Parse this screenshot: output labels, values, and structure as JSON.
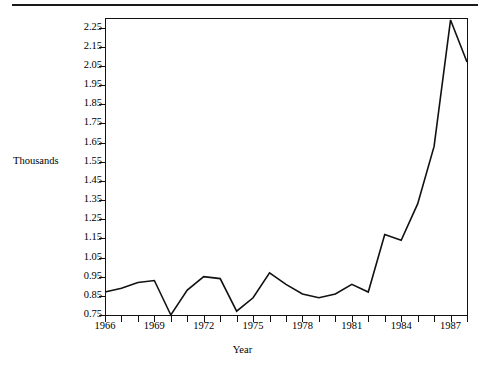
{
  "chart_data": {
    "type": "line",
    "title": "",
    "xlabel": "Year",
    "ylabel": "Thousands",
    "grid": false,
    "legend": "none",
    "line_color": "#111111",
    "xlim": [
      1966,
      1988
    ],
    "ylim": [
      0.75,
      2.3
    ],
    "x_tick_labels": [
      "1966",
      "1969",
      "1972",
      "1975",
      "1978",
      "1981",
      "1984",
      "1987"
    ],
    "x_tick_values": [
      1966,
      1969,
      1972,
      1975,
      1978,
      1981,
      1984,
      1987
    ],
    "x_minor_ticks": [
      1966,
      1967,
      1968,
      1969,
      1970,
      1971,
      1972,
      1973,
      1974,
      1975,
      1976,
      1977,
      1978,
      1979,
      1980,
      1981,
      1982,
      1983,
      1984,
      1985,
      1986,
      1987,
      1988
    ],
    "y_tick_labels": [
      "2.25",
      "2.15",
      "2.05",
      "1.95",
      "1.85",
      "1.75",
      "1.65",
      "1.55",
      "1.45",
      "1.35",
      "1.25",
      "1.15",
      "1.05",
      "0.95",
      "0.85",
      "0.75"
    ],
    "y_tick_values": [
      2.25,
      2.15,
      2.05,
      1.95,
      1.85,
      1.75,
      1.65,
      1.55,
      1.45,
      1.35,
      1.25,
      1.15,
      1.05,
      0.95,
      0.85,
      0.75
    ],
    "x": [
      1966,
      1967,
      1968,
      1969,
      1970,
      1971,
      1972,
      1973,
      1974,
      1975,
      1976,
      1977,
      1978,
      1979,
      1980,
      1981,
      1982,
      1983,
      1984,
      1985,
      1986,
      1987,
      1988
    ],
    "values": [
      0.87,
      0.89,
      0.92,
      0.93,
      0.75,
      0.88,
      0.95,
      0.94,
      0.77,
      0.84,
      0.97,
      0.91,
      0.86,
      0.84,
      0.86,
      0.91,
      0.87,
      1.17,
      1.14,
      1.33,
      1.63,
      2.29,
      2.07
    ],
    "series": [
      {
        "name": "Thousands",
        "values": [
          0.87,
          0.89,
          0.92,
          0.93,
          0.75,
          0.88,
          0.95,
          0.94,
          0.77,
          0.84,
          0.97,
          0.91,
          0.86,
          0.84,
          0.86,
          0.91,
          0.87,
          1.17,
          1.14,
          1.33,
          1.63,
          2.29,
          2.07
        ]
      }
    ]
  }
}
